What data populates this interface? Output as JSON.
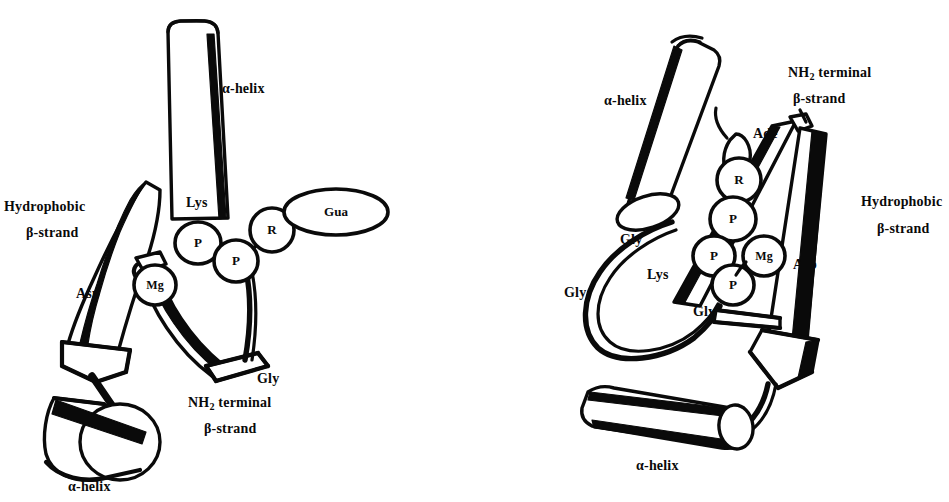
{
  "figure": {
    "type": "schematic-diagram",
    "panels": [
      {
        "id": "left",
        "name": "left-panel",
        "labels": [
          {
            "id": "l-alpha-top",
            "text": "α-helix",
            "x": 222,
            "y": 82,
            "size": "md"
          },
          {
            "id": "l-hydrophobic",
            "text": "Hydrophobic",
            "x": 4,
            "y": 200,
            "size": "md"
          },
          {
            "id": "l-hydro-beta",
            "text": "β-strand",
            "x": 26,
            "y": 226,
            "size": "md"
          },
          {
            "id": "l-lys",
            "text": "Lys",
            "x": 186,
            "y": 196,
            "size": "md"
          },
          {
            "id": "l-asp",
            "text": "Asp",
            "x": 76,
            "y": 287,
            "size": "md"
          },
          {
            "id": "l-gly",
            "text": "Gly",
            "x": 257,
            "y": 372,
            "size": "md"
          },
          {
            "id": "l-nh2",
            "text": "NH",
            "x": 188,
            "y": 396,
            "size": "md",
            "sub": "2",
            "tail": " terminal"
          },
          {
            "id": "l-nh2-beta",
            "text": "β-strand",
            "x": 204,
            "y": 422,
            "size": "md"
          },
          {
            "id": "l-alpha-bot",
            "text": "α-helix",
            "x": 68,
            "y": 480,
            "size": "md"
          }
        ],
        "nodes": [
          {
            "id": "l-p1",
            "label": "P",
            "cx": 198,
            "cy": 243,
            "rx": 20,
            "ry": 19
          },
          {
            "id": "l-p2",
            "label": "P",
            "cx": 236,
            "cy": 260,
            "rx": 20,
            "ry": 19
          },
          {
            "id": "l-r",
            "label": "R",
            "cx": 271,
            "cy": 230,
            "rx": 20,
            "ry": 20
          },
          {
            "id": "l-gua",
            "label": "Gua",
            "cx": 335,
            "cy": 212,
            "rx": 50,
            "ry": 22
          },
          {
            "id": "l-mg",
            "label": "Mg",
            "cx": 155,
            "cy": 285,
            "rx": 19,
            "ry": 18
          }
        ]
      },
      {
        "id": "right",
        "name": "right-panel",
        "labels": [
          {
            "id": "r-alpha-top",
            "text": "α-helix",
            "x": 604,
            "y": 94,
            "size": "md"
          },
          {
            "id": "r-nh2",
            "text": "NH",
            "x": 788,
            "y": 66,
            "size": "md",
            "sub": "2",
            "tail": " terminal"
          },
          {
            "id": "r-nh2-beta",
            "text": "β-strand",
            "x": 793,
            "y": 92,
            "size": "md"
          },
          {
            "id": "r-ade",
            "text": "Ade",
            "x": 753,
            "y": 127,
            "size": "md"
          },
          {
            "id": "r-hydrophobic",
            "text": "Hydrophobic",
            "x": 861,
            "y": 195,
            "size": "md"
          },
          {
            "id": "r-hydro-beta",
            "text": "β-strand",
            "x": 877,
            "y": 222,
            "size": "md"
          },
          {
            "id": "r-gly1",
            "text": "Gly",
            "x": 620,
            "y": 233,
            "size": "md"
          },
          {
            "id": "r-asp",
            "text": "Asp",
            "x": 793,
            "y": 258,
            "size": "md"
          },
          {
            "id": "r-lys",
            "text": "Lys",
            "x": 647,
            "y": 268,
            "size": "md"
          },
          {
            "id": "r-gly2",
            "text": "Gly",
            "x": 564,
            "y": 286,
            "size": "md"
          },
          {
            "id": "r-gly3",
            "text": "Gly",
            "x": 693,
            "y": 305,
            "size": "md"
          },
          {
            "id": "r-alpha-bot",
            "text": "α-helix",
            "x": 636,
            "y": 459,
            "size": "md"
          }
        ],
        "nodes": [
          {
            "id": "r-r",
            "label": "R",
            "cx": 739,
            "cy": 180,
            "rx": 20,
            "ry": 20
          },
          {
            "id": "r-p1",
            "label": "P",
            "cx": 733,
            "cy": 219,
            "rx": 21,
            "ry": 20
          },
          {
            "id": "r-p2",
            "label": "P",
            "cx": 714,
            "cy": 255,
            "rx": 19,
            "ry": 19
          },
          {
            "id": "r-p3",
            "label": "P",
            "cx": 733,
            "cy": 284,
            "rx": 19,
            "ry": 19
          },
          {
            "id": "r-mg",
            "label": "Mg",
            "cx": 763,
            "cy": 256,
            "rx": 19,
            "ry": 18
          }
        ]
      }
    ],
    "colors": {
      "ink": "#0a0a0a",
      "background": "#ffffff",
      "fill": "#ffffff"
    }
  }
}
